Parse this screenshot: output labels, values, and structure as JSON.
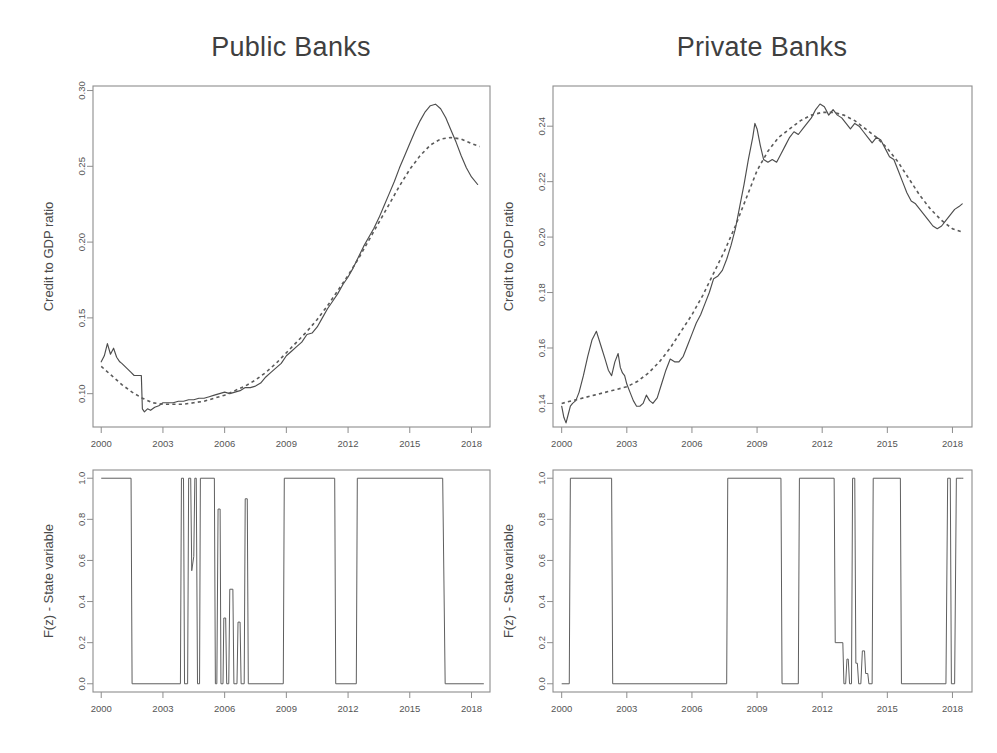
{
  "figure": {
    "background": "#ffffff",
    "line_color": "#4d4d4d",
    "frame_color": "#8d8d8d",
    "panels": 4,
    "layout": "2x2"
  },
  "chart_data": [
    {
      "id": "public-credit",
      "type": "line",
      "title": "Public Banks",
      "xlabel": "",
      "ylabel": "Credit to GDP ratio",
      "xlim": [
        1999.6,
        2018.9
      ],
      "ylim": [
        0.078,
        0.303
      ],
      "xticks": [
        2000,
        2003,
        2006,
        2009,
        2012,
        2015,
        2018
      ],
      "xticklabels": [
        "2000",
        "2003",
        "2006",
        "2009",
        "2012",
        "2015",
        "2018"
      ],
      "yticks": [
        0.1,
        0.15,
        0.2,
        0.25,
        0.3
      ],
      "yticklabels": [
        "0.10",
        "0.15",
        "0.20",
        "0.25",
        "0.30"
      ],
      "grid": false,
      "legend": "none",
      "series": [
        {
          "name": "Credit to GDP ratio (observed)",
          "style": "solid",
          "x": [
            2000.0,
            2000.15,
            2000.3,
            2000.45,
            2000.6,
            2000.75,
            2000.9,
            2001.0,
            2001.15,
            2001.3,
            2001.45,
            2001.6,
            2001.75,
            2001.85,
            2001.95,
            2002.0,
            2002.1,
            2002.25,
            2002.4,
            2002.6,
            2002.8,
            2003.0,
            2003.25,
            2003.5,
            2003.75,
            2004.0,
            2004.25,
            2004.5,
            2004.75,
            2005.0,
            2005.25,
            2005.5,
            2005.75,
            2006.0,
            2006.25,
            2006.5,
            2006.75,
            2007.0,
            2007.25,
            2007.5,
            2007.75,
            2008.0,
            2008.25,
            2008.5,
            2008.75,
            2009.0,
            2009.25,
            2009.5,
            2009.75,
            2010.0,
            2010.25,
            2010.5,
            2010.75,
            2011.0,
            2011.25,
            2011.5,
            2011.75,
            2012.0,
            2012.25,
            2012.5,
            2012.75,
            2013.0,
            2013.25,
            2013.5,
            2013.75,
            2014.0,
            2014.25,
            2014.5,
            2014.75,
            2015.0,
            2015.25,
            2015.5,
            2015.75,
            2016.0,
            2016.25,
            2016.5,
            2016.75,
            2017.0,
            2017.25,
            2017.5,
            2017.75,
            2018.0,
            2018.3
          ],
          "y": [
            0.121,
            0.125,
            0.133,
            0.126,
            0.13,
            0.124,
            0.121,
            0.12,
            0.118,
            0.116,
            0.114,
            0.112,
            0.112,
            0.112,
            0.112,
            0.09,
            0.088,
            0.09,
            0.089,
            0.091,
            0.092,
            0.094,
            0.094,
            0.094,
            0.095,
            0.095,
            0.096,
            0.096,
            0.097,
            0.097,
            0.098,
            0.099,
            0.1,
            0.101,
            0.1,
            0.101,
            0.102,
            0.104,
            0.104,
            0.105,
            0.107,
            0.111,
            0.114,
            0.117,
            0.12,
            0.125,
            0.128,
            0.131,
            0.134,
            0.139,
            0.14,
            0.144,
            0.15,
            0.156,
            0.161,
            0.166,
            0.172,
            0.177,
            0.183,
            0.19,
            0.197,
            0.203,
            0.209,
            0.216,
            0.224,
            0.232,
            0.24,
            0.249,
            0.257,
            0.265,
            0.273,
            0.28,
            0.286,
            0.29,
            0.291,
            0.288,
            0.282,
            0.274,
            0.266,
            0.257,
            0.249,
            0.243,
            0.238
          ]
        },
        {
          "name": "Smoothed trend",
          "style": "dashed",
          "x": [
            2000.0,
            2000.5,
            2001.0,
            2001.5,
            2002.0,
            2002.5,
            2003.0,
            2003.5,
            2004.0,
            2004.5,
            2005.0,
            2005.5,
            2006.0,
            2006.5,
            2007.0,
            2007.5,
            2008.0,
            2008.5,
            2009.0,
            2009.5,
            2010.0,
            2010.5,
            2011.0,
            2011.5,
            2012.0,
            2012.5,
            2013.0,
            2013.5,
            2014.0,
            2014.5,
            2015.0,
            2015.5,
            2016.0,
            2016.5,
            2017.0,
            2017.5,
            2018.0,
            2018.4
          ],
          "y": [
            0.118,
            0.112,
            0.106,
            0.101,
            0.097,
            0.094,
            0.093,
            0.093,
            0.093,
            0.094,
            0.095,
            0.097,
            0.099,
            0.102,
            0.105,
            0.109,
            0.114,
            0.12,
            0.127,
            0.134,
            0.141,
            0.149,
            0.158,
            0.168,
            0.178,
            0.189,
            0.201,
            0.213,
            0.225,
            0.237,
            0.248,
            0.257,
            0.264,
            0.268,
            0.269,
            0.268,
            0.265,
            0.263
          ]
        }
      ]
    },
    {
      "id": "private-credit",
      "type": "line",
      "title": "Private Banks",
      "xlabel": "",
      "ylabel": "Credit to GDP ratio",
      "xlim": [
        1999.6,
        2018.9
      ],
      "ylim": [
        0.1315,
        0.2545
      ],
      "xticks": [
        2000,
        2003,
        2006,
        2009,
        2012,
        2015,
        2018
      ],
      "xticklabels": [
        "2000",
        "2003",
        "2006",
        "2009",
        "2012",
        "2015",
        "2018"
      ],
      "yticks": [
        0.14,
        0.16,
        0.18,
        0.2,
        0.22,
        0.24
      ],
      "yticklabels": [
        "0.14",
        "0.16",
        "0.18",
        "0.20",
        "0.22",
        "0.24"
      ],
      "grid": false,
      "legend": "none",
      "series": [
        {
          "name": "Credit to GDP ratio (observed)",
          "style": "solid",
          "x": [
            2000.0,
            2000.1,
            2000.2,
            2000.3,
            2000.4,
            2000.5,
            2000.65,
            2000.8,
            2001.0,
            2001.2,
            2001.4,
            2001.6,
            2001.8,
            2002.0,
            2002.15,
            2002.3,
            2002.45,
            2002.6,
            2002.7,
            2002.8,
            2002.9,
            2003.0,
            2003.15,
            2003.3,
            2003.45,
            2003.6,
            2003.75,
            2003.9,
            2004.05,
            2004.2,
            2004.4,
            2004.6,
            2004.8,
            2005.0,
            2005.2,
            2005.4,
            2005.6,
            2005.8,
            2006.0,
            2006.2,
            2006.4,
            2006.6,
            2006.8,
            2007.0,
            2007.2,
            2007.4,
            2007.6,
            2007.8,
            2008.0,
            2008.2,
            2008.4,
            2008.6,
            2008.8,
            2008.9,
            2009.0,
            2009.15,
            2009.3,
            2009.5,
            2009.7,
            2009.9,
            2010.1,
            2010.3,
            2010.5,
            2010.7,
            2010.9,
            2011.1,
            2011.3,
            2011.5,
            2011.7,
            2011.9,
            2012.1,
            2012.3,
            2012.5,
            2012.7,
            2012.9,
            2013.1,
            2013.3,
            2013.5,
            2013.7,
            2013.9,
            2014.1,
            2014.3,
            2014.5,
            2014.7,
            2014.9,
            2015.1,
            2015.3,
            2015.5,
            2015.7,
            2015.9,
            2016.1,
            2016.3,
            2016.5,
            2016.7,
            2016.9,
            2017.1,
            2017.3,
            2017.5,
            2017.7,
            2017.9,
            2018.1,
            2018.3,
            2018.45
          ],
          "y": [
            0.139,
            0.135,
            0.133,
            0.136,
            0.139,
            0.14,
            0.141,
            0.144,
            0.15,
            0.157,
            0.163,
            0.166,
            0.161,
            0.156,
            0.152,
            0.15,
            0.155,
            0.158,
            0.153,
            0.151,
            0.15,
            0.147,
            0.144,
            0.141,
            0.139,
            0.139,
            0.14,
            0.143,
            0.141,
            0.14,
            0.142,
            0.147,
            0.152,
            0.156,
            0.155,
            0.155,
            0.157,
            0.161,
            0.165,
            0.169,
            0.172,
            0.176,
            0.18,
            0.185,
            0.186,
            0.188,
            0.192,
            0.197,
            0.203,
            0.211,
            0.219,
            0.228,
            0.236,
            0.241,
            0.239,
            0.233,
            0.228,
            0.227,
            0.228,
            0.227,
            0.23,
            0.233,
            0.236,
            0.238,
            0.237,
            0.239,
            0.241,
            0.243,
            0.246,
            0.248,
            0.247,
            0.244,
            0.246,
            0.244,
            0.243,
            0.241,
            0.239,
            0.241,
            0.24,
            0.238,
            0.236,
            0.234,
            0.236,
            0.235,
            0.232,
            0.229,
            0.228,
            0.224,
            0.22,
            0.216,
            0.213,
            0.212,
            0.21,
            0.208,
            0.206,
            0.204,
            0.203,
            0.204,
            0.206,
            0.208,
            0.21,
            0.211,
            0.212
          ]
        },
        {
          "name": "Smoothed trend",
          "style": "dashed",
          "x": [
            2000.0,
            2000.5,
            2001.0,
            2001.5,
            2002.0,
            2002.5,
            2003.0,
            2003.5,
            2004.0,
            2004.5,
            2005.0,
            2005.5,
            2006.0,
            2006.5,
            2007.0,
            2007.5,
            2008.0,
            2008.5,
            2008.8,
            2009.0,
            2009.5,
            2010.0,
            2010.5,
            2011.0,
            2011.5,
            2012.0,
            2012.5,
            2013.0,
            2013.5,
            2014.0,
            2014.5,
            2015.0,
            2015.5,
            2016.0,
            2016.5,
            2017.0,
            2017.5,
            2018.0,
            2018.4
          ],
          "y": [
            0.14,
            0.141,
            0.142,
            0.143,
            0.144,
            0.145,
            0.146,
            0.148,
            0.151,
            0.155,
            0.16,
            0.166,
            0.172,
            0.179,
            0.187,
            0.195,
            0.204,
            0.214,
            0.22,
            0.224,
            0.231,
            0.236,
            0.239,
            0.242,
            0.244,
            0.245,
            0.245,
            0.244,
            0.242,
            0.239,
            0.236,
            0.232,
            0.227,
            0.221,
            0.215,
            0.21,
            0.206,
            0.203,
            0.202
          ]
        }
      ]
    },
    {
      "id": "public-state",
      "type": "line",
      "title": "",
      "xlabel": "",
      "ylabel": "F(z) - State variable",
      "xlim": [
        1999.6,
        2018.9
      ],
      "ylim": [
        -0.04,
        1.04
      ],
      "xticks": [
        2000,
        2003,
        2006,
        2009,
        2012,
        2015,
        2018
      ],
      "xticklabels": [
        "2000",
        "2003",
        "2006",
        "2009",
        "2012",
        "2015",
        "2018"
      ],
      "yticks": [
        0.0,
        0.2,
        0.4,
        0.6,
        0.8,
        1.0
      ],
      "yticklabels": [
        "0.0",
        "0.2",
        "0.4",
        "0.6",
        "0.8",
        "1.0"
      ],
      "grid": false,
      "legend": "none",
      "series": [
        {
          "name": "F(z) - State variable",
          "style": "state",
          "x": [
            2000.0,
            2001.45,
            2001.5,
            2003.85,
            2003.9,
            2004.0,
            2004.05,
            2004.2,
            2004.25,
            2004.35,
            2004.4,
            2004.5,
            2004.55,
            2004.62,
            2004.68,
            2004.78,
            2004.82,
            2005.5,
            2005.55,
            2005.62,
            2005.68,
            2005.78,
            2005.82,
            2005.92,
            2005.96,
            2006.05,
            2006.1,
            2006.2,
            2006.25,
            2006.4,
            2006.45,
            2006.6,
            2006.65,
            2006.75,
            2006.8,
            2006.95,
            2007.0,
            2007.1,
            2007.15,
            2008.85,
            2008.9,
            2011.35,
            2011.4,
            2012.4,
            2012.45,
            2016.6,
            2016.72,
            2018.6
          ],
          "y": [
            1.0,
            1.0,
            0.0,
            0.0,
            1.0,
            1.0,
            0.0,
            0.0,
            1.0,
            1.0,
            0.55,
            0.62,
            1.0,
            1.0,
            0.0,
            0.0,
            1.0,
            1.0,
            0.0,
            0.0,
            0.85,
            0.85,
            0.0,
            0.0,
            0.32,
            0.32,
            0.0,
            0.0,
            0.46,
            0.46,
            0.0,
            0.0,
            0.3,
            0.3,
            0.0,
            0.0,
            0.9,
            0.9,
            0.0,
            0.0,
            1.0,
            1.0,
            0.0,
            0.0,
            1.0,
            1.0,
            0.0,
            0.0
          ]
        }
      ]
    },
    {
      "id": "private-state",
      "type": "line",
      "title": "",
      "xlabel": "",
      "ylabel": "F(z) - State variable",
      "xlim": [
        1999.6,
        2018.9
      ],
      "ylim": [
        -0.04,
        1.04
      ],
      "xticks": [
        2000,
        2003,
        2006,
        2009,
        2012,
        2015,
        2018
      ],
      "xticklabels": [
        "2000",
        "2003",
        "2006",
        "2009",
        "2012",
        "2015",
        "2018"
      ],
      "yticks": [
        0.0,
        0.2,
        0.4,
        0.6,
        0.8,
        1.0
      ],
      "yticklabels": [
        "0.0",
        "0.2",
        "0.4",
        "0.6",
        "0.8",
        "1.0"
      ],
      "grid": false,
      "legend": "none",
      "series": [
        {
          "name": "F(z) - State variable",
          "style": "state",
          "x": [
            2000.0,
            2000.35,
            2000.4,
            2002.3,
            2002.35,
            2007.6,
            2007.65,
            2010.1,
            2010.15,
            2010.9,
            2010.95,
            2012.55,
            2012.6,
            2012.95,
            2013.0,
            2013.08,
            2013.14,
            2013.2,
            2013.26,
            2013.35,
            2013.4,
            2013.5,
            2013.55,
            2013.62,
            2013.68,
            2013.78,
            2013.85,
            2013.95,
            2014.0,
            2014.1,
            2014.15,
            2014.3,
            2014.35,
            2015.6,
            2015.65,
            2017.7,
            2017.78,
            2017.9,
            2017.95,
            2018.1,
            2018.18,
            2018.3,
            2018.4,
            2018.5
          ],
          "y": [
            0.0,
            0.0,
            1.0,
            1.0,
            0.0,
            0.0,
            1.0,
            1.0,
            0.0,
            0.0,
            1.0,
            1.0,
            0.2,
            0.2,
            0.0,
            0.0,
            0.12,
            0.12,
            0.0,
            0.0,
            1.0,
            1.0,
            0.1,
            0.1,
            0.0,
            0.0,
            0.16,
            0.16,
            0.05,
            0.05,
            0.0,
            0.0,
            1.0,
            1.0,
            0.0,
            0.0,
            1.0,
            1.0,
            0.0,
            0.0,
            1.0,
            1.0,
            1.0,
            1.0
          ]
        }
      ]
    }
  ]
}
